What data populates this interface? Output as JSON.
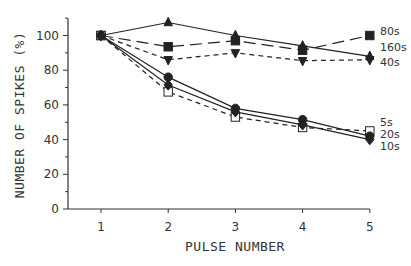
{
  "chart_data": {
    "type": "line",
    "title": "",
    "xlabel": "PULSE NUMBER",
    "ylabel": "NUMBER OF SPIKES (%)",
    "x": [
      1,
      2,
      3,
      4,
      5
    ],
    "xticks": [
      "1",
      "2",
      "3",
      "4",
      "5"
    ],
    "yticks": [
      "0",
      "20",
      "40",
      "60",
      "80",
      "100"
    ],
    "xlim": [
      0.5,
      5
    ],
    "ylim": [
      0,
      110
    ],
    "grid": false,
    "legend_position": "right-end labels",
    "series": [
      {
        "name": "80s",
        "marker": "square-filled",
        "line": "long-dash",
        "values": [
          100,
          93.5,
          97,
          91.5,
          100
        ]
      },
      {
        "name": "160s",
        "marker": "triangle-up",
        "line": "solid",
        "values": [
          100,
          107.5,
          100,
          94,
          88
        ]
      },
      {
        "name": "40s",
        "marker": "triangle-down",
        "line": "short-dash",
        "values": [
          100,
          86,
          90,
          85.5,
          86
        ]
      },
      {
        "name": "5s",
        "marker": "square-open",
        "line": "short-dash",
        "values": [
          100,
          67.5,
          53,
          47,
          45
        ]
      },
      {
        "name": "20s",
        "marker": "circle-filled",
        "line": "solid",
        "values": [
          100,
          76,
          58,
          51.5,
          42
        ]
      },
      {
        "name": "10s",
        "marker": "diamond-filled",
        "line": "solid",
        "values": [
          100,
          71.5,
          56,
          48.5,
          40
        ]
      }
    ]
  },
  "legend": {
    "labels": [
      "80s",
      "160s",
      "40s",
      "5s",
      "20s",
      "10s"
    ]
  }
}
